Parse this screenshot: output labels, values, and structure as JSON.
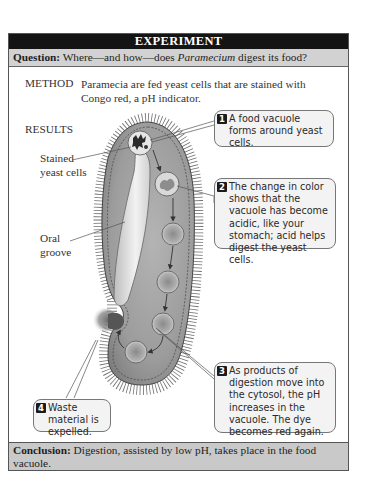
{
  "header": {
    "title": "EXPERIMENT"
  },
  "question": {
    "label": "Question:",
    "text_before": " Where—and how—does ",
    "organism": "Paramecium",
    "text_after": " digest its food?"
  },
  "method": {
    "label": "METHOD",
    "text": "Paramecia are fed yeast cells that are stained with Congo red, a pH indicator."
  },
  "results": {
    "label": "RESULTS",
    "labels": {
      "stained_yeast": [
        "Stained",
        "yeast cells"
      ],
      "oral_groove": [
        "Oral",
        "groove"
      ]
    },
    "callouts": [
      {
        "number": "1",
        "text": "A food vacuole forms around yeast cells."
      },
      {
        "number": "2",
        "text": "The change in color shows that the vacuole has become acidic, like your stomach; acid helps digest the yeast cells."
      },
      {
        "number": "3",
        "text": "As products of digestion move into the cytosol, the pH increases in the vacuole. The dye becomes red again."
      },
      {
        "number": "4",
        "text": "Waste material is expelled."
      }
    ]
  },
  "conclusion": {
    "label": "Conclusion:",
    "text": " Digestion, assisted by low pH, takes place in the food vacuole."
  },
  "colors": {
    "header_bg": "#141414",
    "question_bg": "#d2d2d2",
    "conclusion_bg": "#c9c9c9",
    "cell_fill": "#9a9a9a",
    "callout_bg": "#f3f3f3"
  }
}
